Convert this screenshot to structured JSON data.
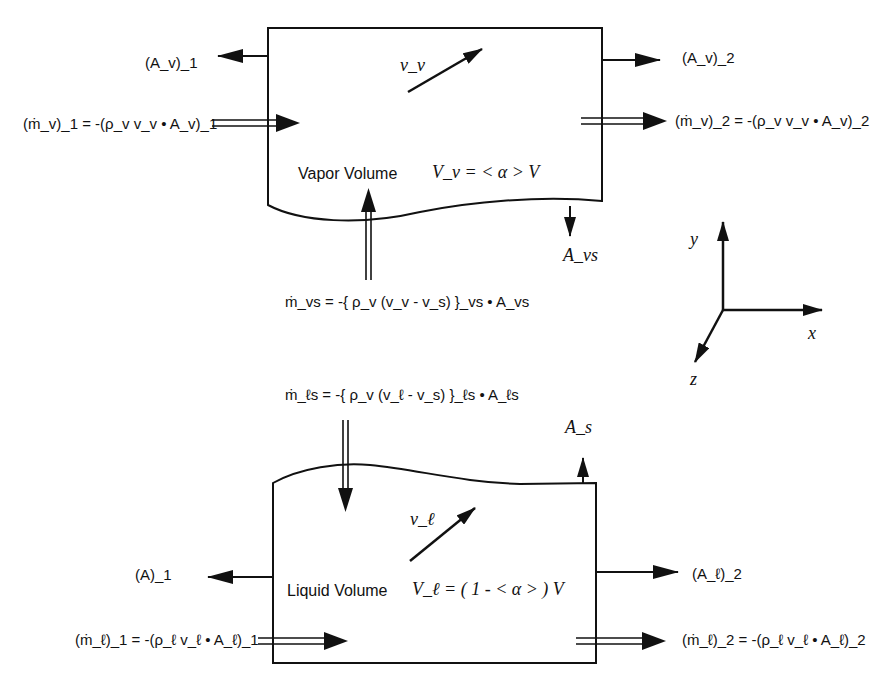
{
  "vapor": {
    "label": "Vapor Volume",
    "volume_eq": "V_v = < α > V",
    "velocity": "v_v",
    "area_in": "(A_v)_1",
    "area_out": "(A_v)_2",
    "mass_in": "(ṁ_v)_1 = -(ρ_v v_v • A_v)_1",
    "mass_out": "(ṁ_v)_2 = -(ρ_v v_v • A_v)_2",
    "interface_area": "A_vs",
    "interface_mass": "ṁ_vs = -{ ρ_v (v_v - v_s) }_vs • A_vs"
  },
  "liquid": {
    "label": "Liquid Volume",
    "volume_eq": "V_ℓ = ( 1 - < α > ) V",
    "velocity": "v_ℓ",
    "area_in": "(A)_1",
    "area_out": "(A_ℓ)_2",
    "mass_in": "(ṁ_ℓ)_1 = -(ρ_ℓ v_ℓ • A_ℓ)_1",
    "mass_out": "(ṁ_ℓ)_2 = -(ρ_ℓ v_ℓ • A_ℓ)_2",
    "interface_area": "A_s",
    "interface_mass": "ṁ_ℓs = -{ ρ_v (v_ℓ - v_s) }_ℓs • A_ℓs"
  },
  "axes": {
    "x": "x",
    "y": "y",
    "z": "z"
  }
}
